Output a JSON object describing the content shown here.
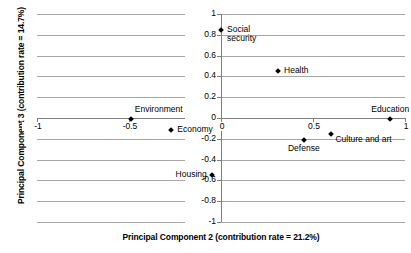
{
  "chart_data": {
    "type": "scatter",
    "title": "",
    "xlabel": "Principal Component 2 (contribution rate = 21.2%)",
    "ylabel": "Principal Component 3 (contribution rate = 14.7%)",
    "xlim": [
      -1,
      1
    ],
    "ylim": [
      -1,
      1
    ],
    "grid": true,
    "legend": false,
    "xticks": [
      {
        "value": -1,
        "label": "-1"
      },
      {
        "value": -0.5,
        "label": "-0.5"
      },
      {
        "value": 0,
        "label": "0"
      },
      {
        "value": 0.5,
        "label": "0.5"
      },
      {
        "value": 1,
        "label": "1"
      }
    ],
    "yticks": [
      {
        "value": 1,
        "label": "1"
      },
      {
        "value": 0.8,
        "label": "0.8"
      },
      {
        "value": 0.6,
        "label": "0.6"
      },
      {
        "value": 0.4,
        "label": "0.4"
      },
      {
        "value": 0.2,
        "label": "0.2"
      },
      {
        "value": 0,
        "label": "0"
      },
      {
        "value": -0.2,
        "label": "-0.2"
      },
      {
        "value": -0.4,
        "label": "-0.4"
      },
      {
        "value": -0.6,
        "label": "-0.6"
      },
      {
        "value": -0.8,
        "label": "-0.8"
      },
      {
        "value": -1,
        "label": "-1"
      }
    ],
    "marker_shape": "diamond",
    "marker_color": "#000000",
    "points": [
      {
        "label": "Social\nsecurity",
        "label_text": "Social security",
        "x": 0.0,
        "y": 0.85,
        "label_dx": 6,
        "label_dy": -5,
        "align": "left"
      },
      {
        "label": "Health",
        "label_text": "Health",
        "x": 0.31,
        "y": 0.45,
        "label_dx": 6,
        "label_dy": -5,
        "align": "left"
      },
      {
        "label": "Environment",
        "label_text": "Environment",
        "x": -0.49,
        "y": -0.01,
        "label_dx": 4,
        "label_dy": -14,
        "align": "left"
      },
      {
        "label": "Economy",
        "label_text": "Economy",
        "x": -0.27,
        "y": -0.12,
        "label_dx": 6,
        "label_dy": -5,
        "align": "left"
      },
      {
        "label": "Education",
        "label_text": "Education",
        "x": 0.92,
        "y": -0.01,
        "label_dx": 0,
        "label_dy": -14,
        "align": "center"
      },
      {
        "label": "Culture and art",
        "label_text": "Culture and art",
        "x": 0.6,
        "y": -0.15,
        "label_dx": 4,
        "label_dy": 1,
        "align": "left"
      },
      {
        "label": "Defense",
        "label_text": "Defense",
        "x": 0.45,
        "y": -0.21,
        "label_dx": 0,
        "label_dy": 4,
        "align": "center"
      },
      {
        "label": "Housing",
        "label_text": "Housing",
        "x": -0.05,
        "y": -0.55,
        "label_dx": -5,
        "label_dy": -5,
        "align": "right"
      }
    ]
  }
}
